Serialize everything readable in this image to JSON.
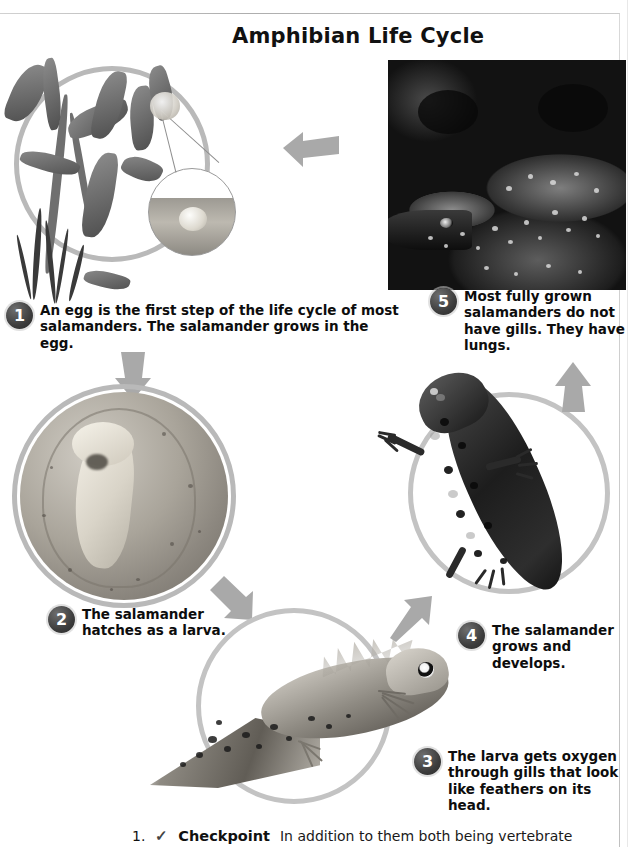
{
  "page": {
    "title": "Amphibian Life Cycle"
  },
  "steps": [
    {
      "number": "1",
      "text": "An egg is the first step of the life cycle of most salamanders. The salamander grows in the egg.",
      "image_name": "egg-on-plant-photo"
    },
    {
      "number": "2",
      "text": "The salamander hatches as a larva.",
      "image_name": "embryo-in-egg-photo"
    },
    {
      "number": "3",
      "text": "The larva gets oxygen through gills that look like feathers on its head.",
      "image_name": "larva-with-gills-photo"
    },
    {
      "number": "4",
      "text": "The salamander grows and develops.",
      "image_name": "juvenile-salamander-photo"
    },
    {
      "number": "5",
      "text": "Most fully grown salamanders do not have gills. They have lungs.",
      "image_name": "adult-salamander-photo"
    }
  ],
  "footer": {
    "item_number": "1.",
    "check_mark": "✓",
    "checkpoint_label": "Checkpoint",
    "text": "In addition to them both being vertebrate"
  },
  "colors": {
    "ring": "#b9b9b9",
    "arrow": "#a8a8a8",
    "badge": "#3c3c3c",
    "text": "#0d0d0d",
    "background": "#ffffff"
  }
}
